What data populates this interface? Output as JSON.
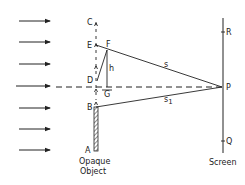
{
  "diagram": {
    "points": {
      "C": "C",
      "E": "E",
      "F": "F",
      "D": "D",
      "G": "G",
      "B": "B",
      "A": "A",
      "R": "R",
      "P": "P",
      "Q": "Q"
    },
    "segments": {
      "h": "h",
      "s": "s",
      "s1_main": "s",
      "s1_sub": "1"
    },
    "labels": {
      "object_line1": "Opaque",
      "object_line2": "Object",
      "screen": "Screen"
    },
    "incident_arrows": 7,
    "colors": {
      "line": "#222222",
      "background": "#ffffff"
    }
  }
}
